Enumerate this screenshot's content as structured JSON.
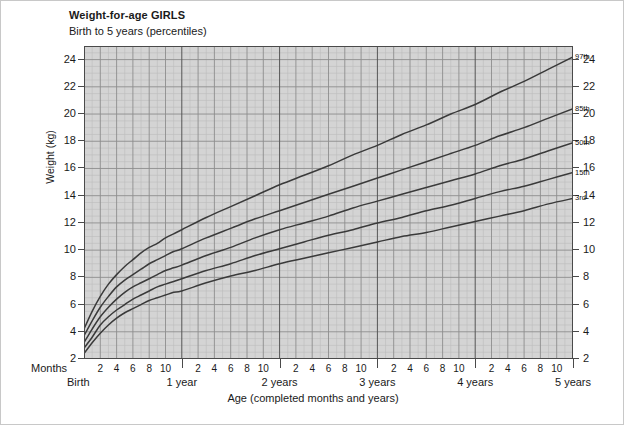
{
  "chart_data": {
    "type": "line",
    "title": "Weight-for-age GIRLS",
    "subtitle": "Birth to 5 years (percentiles)",
    "xlabel": "Age (completed months and years)",
    "ylabel": "Weight (kg)",
    "xlim": [
      0,
      60
    ],
    "ylim": [
      2,
      25
    ],
    "grid": true,
    "legend_position": "right-inline",
    "x_unit": "months",
    "y_unit": "kg",
    "x_month_ticks": [
      2,
      4,
      6,
      8,
      10
    ],
    "y_ticks": [
      2,
      4,
      6,
      8,
      10,
      12,
      14,
      16,
      18,
      20,
      22,
      24
    ],
    "x_year_markers": [
      {
        "months": 0,
        "label": "Birth"
      },
      {
        "months": 12,
        "label": "1 year"
      },
      {
        "months": 24,
        "label": "2 years"
      },
      {
        "months": 36,
        "label": "3 years"
      },
      {
        "months": 48,
        "label": "4 years"
      },
      {
        "months": 60,
        "label": "5 years"
      }
    ],
    "x": [
      0,
      1,
      2,
      3,
      4,
      5,
      6,
      7,
      8,
      9,
      10,
      11,
      12,
      15,
      18,
      21,
      24,
      27,
      30,
      33,
      36,
      39,
      42,
      45,
      48,
      51,
      54,
      57,
      60
    ],
    "series": [
      {
        "name": "97th",
        "label": "97th",
        "color": "#3a3a3a",
        "values": [
          4.2,
          5.5,
          6.6,
          7.5,
          8.2,
          8.8,
          9.3,
          9.8,
          10.2,
          10.5,
          10.9,
          11.2,
          11.5,
          12.4,
          13.2,
          14.0,
          14.8,
          15.5,
          16.2,
          17.0,
          17.7,
          18.5,
          19.2,
          20.0,
          20.7,
          21.6,
          22.4,
          23.3,
          24.2
        ]
      },
      {
        "name": "85th",
        "label": "85th",
        "color": "#3a3a3a",
        "values": [
          3.7,
          4.8,
          5.8,
          6.6,
          7.3,
          7.8,
          8.2,
          8.6,
          9.0,
          9.3,
          9.6,
          9.9,
          10.1,
          10.9,
          11.6,
          12.3,
          12.9,
          13.5,
          14.1,
          14.7,
          15.3,
          15.9,
          16.5,
          17.1,
          17.7,
          18.4,
          19.0,
          19.7,
          20.4
        ]
      },
      {
        "name": "50th",
        "label": "50th",
        "color": "#3a3a3a",
        "values": [
          3.2,
          4.2,
          5.1,
          5.8,
          6.4,
          6.9,
          7.3,
          7.6,
          7.9,
          8.2,
          8.5,
          8.7,
          8.9,
          9.6,
          10.2,
          10.9,
          11.5,
          12.0,
          12.5,
          13.1,
          13.6,
          14.1,
          14.6,
          15.1,
          15.6,
          16.2,
          16.7,
          17.3,
          17.9
        ]
      },
      {
        "name": "15th",
        "label": "15th",
        "color": "#3a3a3a",
        "values": [
          2.8,
          3.6,
          4.5,
          5.1,
          5.6,
          6.0,
          6.4,
          6.7,
          7.0,
          7.3,
          7.5,
          7.7,
          7.9,
          8.5,
          9.0,
          9.6,
          10.1,
          10.6,
          11.1,
          11.5,
          12.0,
          12.4,
          12.9,
          13.3,
          13.8,
          14.3,
          14.7,
          15.2,
          15.7
        ]
      },
      {
        "name": "3rd",
        "label": "3rd",
        "color": "#3a3a3a",
        "values": [
          2.4,
          3.2,
          3.9,
          4.5,
          5.0,
          5.4,
          5.7,
          6.0,
          6.3,
          6.5,
          6.7,
          6.9,
          7.0,
          7.6,
          8.1,
          8.5,
          9.0,
          9.4,
          9.8,
          10.2,
          10.6,
          11.0,
          11.3,
          11.7,
          12.1,
          12.5,
          12.9,
          13.4,
          13.8
        ]
      }
    ],
    "colors": {
      "plot_background": "#d4d4d4",
      "grid_minor": "#bcbcbc",
      "grid_major": "#8d8d8d",
      "grid_year": "#555555",
      "curve": "#3a3a3a",
      "axis": "#4a4a4a",
      "page_background": "#ffffff"
    }
  },
  "axes": {
    "months_caption": "Months",
    "birth_caption": "Birth"
  }
}
